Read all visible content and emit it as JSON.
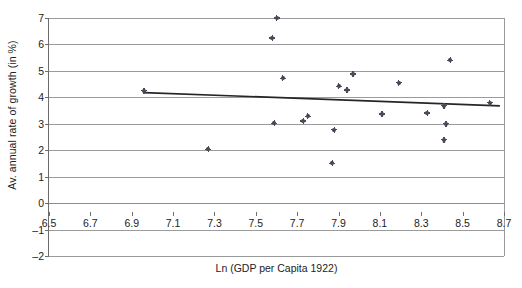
{
  "chart_data": {
    "type": "scatter",
    "title": "",
    "xlabel": "Ln (GDP per Capita 1922)",
    "ylabel": "Av. annual rate of growth (in %)",
    "xlim": [
      6.5,
      8.7
    ],
    "ylim": [
      -2,
      7
    ],
    "xticks": [
      "6.5",
      "6.7",
      "6.9",
      "7.1",
      "7.3",
      "7.5",
      "7.7",
      "7.9",
      "8.1",
      "8.3",
      "8.5",
      "8.7"
    ],
    "xtick_values": [
      6.5,
      6.7,
      6.9,
      7.1,
      7.3,
      7.5,
      7.7,
      7.9,
      8.1,
      8.3,
      8.5,
      8.7
    ],
    "yticks": [
      "7",
      "6",
      "5",
      "4",
      "3",
      "2",
      "1",
      "0",
      "–1",
      "–2"
    ],
    "ytick_values": [
      7,
      6,
      5,
      4,
      3,
      2,
      1,
      0,
      -1,
      -2
    ],
    "grid": true,
    "legend": null,
    "point_color": "#3a3a48",
    "grid_color": "#9b9b9b",
    "axis_color": "#6d6d6d",
    "trend_color": "#262626",
    "points": [
      {
        "x": 6.96,
        "y": 4.25
      },
      {
        "x": 7.27,
        "y": 2.03
      },
      {
        "x": 7.58,
        "y": 6.25
      },
      {
        "x": 7.59,
        "y": 3.02
      },
      {
        "x": 7.6,
        "y": 7.0
      },
      {
        "x": 7.63,
        "y": 4.72
      },
      {
        "x": 7.73,
        "y": 3.1
      },
      {
        "x": 7.75,
        "y": 3.28
      },
      {
        "x": 7.87,
        "y": 1.5
      },
      {
        "x": 7.88,
        "y": 2.78
      },
      {
        "x": 7.9,
        "y": 4.42
      },
      {
        "x": 7.94,
        "y": 4.28
      },
      {
        "x": 7.97,
        "y": 4.88
      },
      {
        "x": 8.11,
        "y": 3.37
      },
      {
        "x": 8.19,
        "y": 4.55
      },
      {
        "x": 8.33,
        "y": 3.41
      },
      {
        "x": 8.41,
        "y": 2.4
      },
      {
        "x": 8.41,
        "y": 3.68
      },
      {
        "x": 8.42,
        "y": 3.0
      },
      {
        "x": 8.44,
        "y": 5.4
      },
      {
        "x": 8.63,
        "y": 3.8
      }
    ],
    "trendline": {
      "type": "linear",
      "x_start": 6.96,
      "y_start": 4.18,
      "x_end": 8.68,
      "y_end": 3.68
    }
  }
}
